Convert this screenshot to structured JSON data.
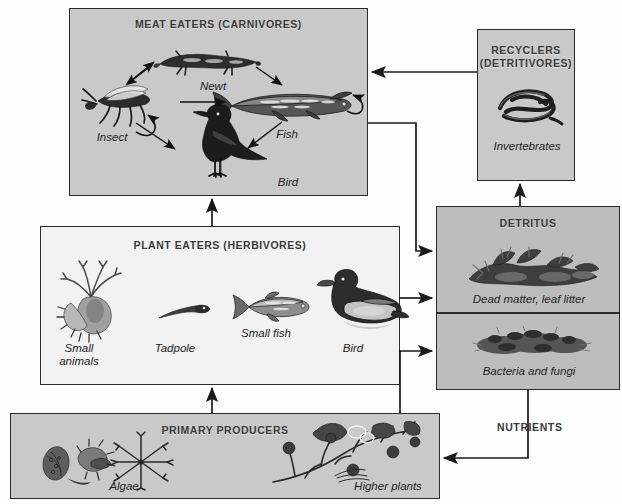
{
  "diagram": {
    "type": "food-web-diagram",
    "background": "#fdfdfd",
    "box_fill_grey": "#c9c9c9",
    "box_fill_light": "#f2f2f2",
    "box_fill_dark": "#bdbdbd",
    "line_color": "#2b2b2b"
  },
  "boxes": {
    "meat_eaters": {
      "title": "MEAT EATERS (CARNIVORES)",
      "organisms": [
        {
          "label": "Newt"
        },
        {
          "label": "Insect"
        },
        {
          "label": "Fish"
        },
        {
          "label": "Bird"
        }
      ]
    },
    "recyclers": {
      "title_line1": "RECYCLERS",
      "title_line2": "(DETRITIVORES)",
      "organisms": [
        {
          "label": "Invertebrates"
        }
      ]
    },
    "plant_eaters": {
      "title": "PLANT EATERS (HERBIVORES)",
      "organisms": [
        {
          "label": "Small animals"
        },
        {
          "label": "Tadpole"
        },
        {
          "label": "Small fish"
        },
        {
          "label": "Bird"
        }
      ]
    },
    "detritus": {
      "title": "DETRITUS",
      "organisms": [
        {
          "label": "Dead matter, leaf litter"
        },
        {
          "label": "Bacteria and fungi"
        }
      ]
    },
    "primary_producers": {
      "title": "PRIMARY PRODUCERS",
      "organisms": [
        {
          "label": "Algae"
        },
        {
          "label": "Higher plants"
        }
      ]
    }
  },
  "labels": {
    "nutrients": "NUTRIENTS"
  },
  "flows": [
    {
      "from": "plant_eaters",
      "to": "meat_eaters"
    },
    {
      "from": "primary_producers",
      "to": "plant_eaters"
    },
    {
      "from": "recyclers",
      "to": "meat_eaters"
    },
    {
      "from": "detritus",
      "to": "recyclers"
    },
    {
      "from": "meat_eaters",
      "to": "detritus"
    },
    {
      "from": "plant_eaters",
      "to": "detritus"
    },
    {
      "from": "primary_producers",
      "to": "detritus"
    },
    {
      "from": "detritus",
      "to": "primary_producers",
      "label": "NUTRIENTS"
    },
    {
      "from": "insect",
      "to": "newt"
    },
    {
      "from": "newt",
      "to": "insect"
    },
    {
      "from": "newt",
      "to": "fish"
    },
    {
      "from": "insect",
      "to": "fish"
    },
    {
      "from": "insect",
      "to": "bird"
    },
    {
      "from": "fish",
      "to": "bird"
    },
    {
      "from": "insect",
      "to": "insect"
    },
    {
      "from": "fish",
      "to": "fish"
    }
  ]
}
